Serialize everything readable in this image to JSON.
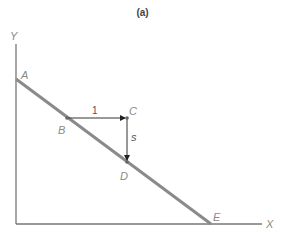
{
  "header": {
    "cut_text": "... t, the line is going downwards, slope is negative ...",
    "panel_label": "(a)"
  },
  "diagram": {
    "axes": {
      "x_label": "X",
      "y_label": "Y"
    },
    "line": {
      "color": "#8a8a8a",
      "start_point": "A",
      "end_point": "E"
    },
    "points": [
      {
        "id": "A",
        "label": "A"
      },
      {
        "id": "B",
        "label": "B"
      },
      {
        "id": "C",
        "label": "C"
      },
      {
        "id": "D",
        "label": "D"
      },
      {
        "id": "E",
        "label": "E"
      }
    ],
    "run_label": "1",
    "rise_label": "s",
    "colors": {
      "axis": "#777777",
      "line": "#8a8a8a",
      "arrow": "#333333",
      "label": "#8a8a8a"
    }
  }
}
